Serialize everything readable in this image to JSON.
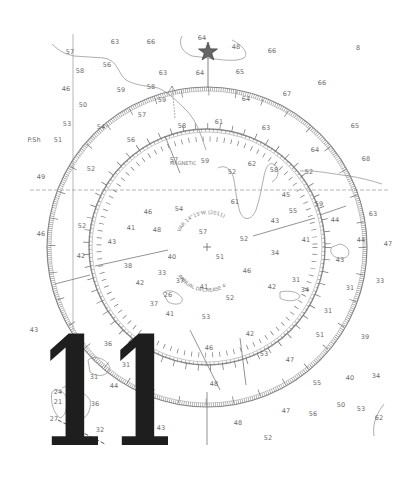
{
  "figure": {
    "big_number": "11",
    "star_symbol": "compass-star",
    "center_inscription_top": "VAR 14°15'W (2011)",
    "center_inscription_bottom": "ANNUAL DECREASE 4'",
    "magnetic_label": "MAGNETIC",
    "side_label": "P.Sh"
  },
  "compass": {
    "center": [
      207,
      247
    ],
    "outer_radius": 160,
    "inner_radius": 116,
    "ring_color": "#8a8a8a"
  },
  "soundings": [
    {
      "t": "63",
      "x": 115,
      "y": 44
    },
    {
      "t": "66",
      "x": 151,
      "y": 44
    },
    {
      "t": "64",
      "x": 202,
      "y": 40
    },
    {
      "t": "48",
      "x": 236,
      "y": 49
    },
    {
      "t": "66",
      "x": 272,
      "y": 53
    },
    {
      "t": "8",
      "x": 358,
      "y": 50
    },
    {
      "t": "57",
      "x": 70,
      "y": 54
    },
    {
      "t": "56",
      "x": 107,
      "y": 67
    },
    {
      "t": "58",
      "x": 80,
      "y": 73
    },
    {
      "t": "63",
      "x": 163,
      "y": 75
    },
    {
      "t": "64",
      "x": 200,
      "y": 75
    },
    {
      "t": "65",
      "x": 240,
      "y": 74
    },
    {
      "t": "66",
      "x": 322,
      "y": 85
    },
    {
      "t": "46",
      "x": 66,
      "y": 91
    },
    {
      "t": "59",
      "x": 121,
      "y": 92
    },
    {
      "t": "58",
      "x": 151,
      "y": 89
    },
    {
      "t": "59",
      "x": 162,
      "y": 102
    },
    {
      "t": "64",
      "x": 246,
      "y": 101
    },
    {
      "t": "67",
      "x": 287,
      "y": 96
    },
    {
      "t": "50",
      "x": 83,
      "y": 107
    },
    {
      "t": "57",
      "x": 142,
      "y": 117
    },
    {
      "t": "58",
      "x": 182,
      "y": 128
    },
    {
      "t": "61",
      "x": 219,
      "y": 124
    },
    {
      "t": "63",
      "x": 266,
      "y": 130
    },
    {
      "t": "65",
      "x": 355,
      "y": 128
    },
    {
      "t": "53",
      "x": 67,
      "y": 126
    },
    {
      "t": "54",
      "x": 101,
      "y": 129
    },
    {
      "t": "P.Sh",
      "x": 34,
      "y": 142
    },
    {
      "t": "51",
      "x": 58,
      "y": 142
    },
    {
      "t": "56",
      "x": 131,
      "y": 142
    },
    {
      "t": "64",
      "x": 315,
      "y": 152
    },
    {
      "t": "68",
      "x": 366,
      "y": 161
    },
    {
      "t": "57",
      "x": 174,
      "y": 162
    },
    {
      "t": "59",
      "x": 205,
      "y": 163
    },
    {
      "t": "62",
      "x": 252,
      "y": 166
    },
    {
      "t": "52",
      "x": 91,
      "y": 171
    },
    {
      "t": "52",
      "x": 232,
      "y": 174
    },
    {
      "t": "58",
      "x": 274,
      "y": 172
    },
    {
      "t": "52",
      "x": 309,
      "y": 174
    },
    {
      "t": "49",
      "x": 41,
      "y": 179
    },
    {
      "t": "61",
      "x": 235,
      "y": 204
    },
    {
      "t": "45",
      "x": 286,
      "y": 197
    },
    {
      "t": "59",
      "x": 319,
      "y": 206
    },
    {
      "t": "46",
      "x": 148,
      "y": 214
    },
    {
      "t": "54",
      "x": 179,
      "y": 211
    },
    {
      "t": "55",
      "x": 293,
      "y": 213
    },
    {
      "t": "44",
      "x": 335,
      "y": 222
    },
    {
      "t": "63",
      "x": 373,
      "y": 216
    },
    {
      "t": "52",
      "x": 82,
      "y": 228
    },
    {
      "t": "41",
      "x": 131,
      "y": 230
    },
    {
      "t": "48",
      "x": 157,
      "y": 232
    },
    {
      "t": "57",
      "x": 203,
      "y": 234
    },
    {
      "t": "43",
      "x": 275,
      "y": 223
    },
    {
      "t": "52",
      "x": 244,
      "y": 241
    },
    {
      "t": "46",
      "x": 41,
      "y": 236
    },
    {
      "t": "43",
      "x": 112,
      "y": 244
    },
    {
      "t": "41",
      "x": 306,
      "y": 242
    },
    {
      "t": "44",
      "x": 361,
      "y": 242
    },
    {
      "t": "47",
      "x": 388,
      "y": 246
    },
    {
      "t": "42",
      "x": 81,
      "y": 258
    },
    {
      "t": "40",
      "x": 172,
      "y": 259
    },
    {
      "t": "51",
      "x": 220,
      "y": 259
    },
    {
      "t": "34",
      "x": 275,
      "y": 255
    },
    {
      "t": "43",
      "x": 340,
      "y": 262
    },
    {
      "t": "38",
      "x": 128,
      "y": 268
    },
    {
      "t": "33",
      "x": 162,
      "y": 275
    },
    {
      "t": "37",
      "x": 180,
      "y": 283
    },
    {
      "t": "46",
      "x": 247,
      "y": 273
    },
    {
      "t": "42",
      "x": 140,
      "y": 285
    },
    {
      "t": "41",
      "x": 204,
      "y": 289
    },
    {
      "t": "42",
      "x": 272,
      "y": 289
    },
    {
      "t": "31",
      "x": 296,
      "y": 282
    },
    {
      "t": "34",
      "x": 305,
      "y": 292
    },
    {
      "t": "31",
      "x": 350,
      "y": 290
    },
    {
      "t": "33",
      "x": 380,
      "y": 283
    },
    {
      "t": "26",
      "x": 168,
      "y": 297
    },
    {
      "t": "52",
      "x": 230,
      "y": 300
    },
    {
      "t": "37",
      "x": 154,
      "y": 306
    },
    {
      "t": "41",
      "x": 170,
      "y": 316
    },
    {
      "t": "53",
      "x": 206,
      "y": 319
    },
    {
      "t": "31",
      "x": 328,
      "y": 313
    },
    {
      "t": "43",
      "x": 34,
      "y": 332
    },
    {
      "t": "42",
      "x": 250,
      "y": 336
    },
    {
      "t": "51",
      "x": 320,
      "y": 337
    },
    {
      "t": "39",
      "x": 365,
      "y": 339
    },
    {
      "t": "36",
      "x": 108,
      "y": 346
    },
    {
      "t": "46",
      "x": 209,
      "y": 350
    },
    {
      "t": "31",
      "x": 126,
      "y": 367
    },
    {
      "t": "53",
      "x": 264,
      "y": 356
    },
    {
      "t": "47",
      "x": 290,
      "y": 362
    },
    {
      "t": "40",
      "x": 350,
      "y": 380
    },
    {
      "t": "34",
      "x": 376,
      "y": 378
    },
    {
      "t": "31",
      "x": 94,
      "y": 379
    },
    {
      "t": "44",
      "x": 114,
      "y": 388
    },
    {
      "t": "48",
      "x": 214,
      "y": 386
    },
    {
      "t": "55",
      "x": 317,
      "y": 385
    },
    {
      "t": "50",
      "x": 341,
      "y": 407
    },
    {
      "t": "53",
      "x": 361,
      "y": 411
    },
    {
      "t": "24",
      "x": 58,
      "y": 394
    },
    {
      "t": "21",
      "x": 58,
      "y": 404
    },
    {
      "t": "36",
      "x": 95,
      "y": 406
    },
    {
      "t": "47",
      "x": 286,
      "y": 413
    },
    {
      "t": "56",
      "x": 313,
      "y": 416
    },
    {
      "t": "62",
      "x": 379,
      "y": 420
    },
    {
      "t": "27",
      "x": 54,
      "y": 421
    },
    {
      "t": "32",
      "x": 100,
      "y": 432
    },
    {
      "t": "43",
      "x": 161,
      "y": 430
    },
    {
      "t": "48",
      "x": 238,
      "y": 425
    },
    {
      "t": "52",
      "x": 268,
      "y": 440
    }
  ]
}
